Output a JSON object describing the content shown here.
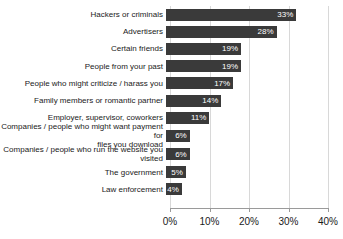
{
  "chart_data": {
    "type": "bar",
    "orientation": "horizontal",
    "title": "",
    "subtitle": "",
    "xlabel": "",
    "ylabel": "",
    "xlim": [
      0,
      40
    ],
    "grid": true,
    "legend": false,
    "tick_labels": [
      "0%",
      "10%",
      "20%",
      "30%",
      "40%"
    ],
    "tick_values": [
      0,
      10,
      20,
      30,
      40
    ],
    "categories": [
      "Hackers or criminals",
      "Advertisers",
      "Certain friends",
      "People from your past",
      "People who might criticize / harass you",
      "Family members or romantic partner",
      "Employer, supervisor, coworkers",
      "Companies / people who might want payment for\nfiles you download",
      "Companies / people who run the website you\nvisited",
      "The government",
      "Law enforcement"
    ],
    "values": [
      33,
      28,
      19,
      19,
      17,
      14,
      11,
      6,
      6,
      5,
      4
    ],
    "value_labels": [
      "33%",
      "28%",
      "19%",
      "19%",
      "17%",
      "14%",
      "11%",
      "6%",
      "6%",
      "5%",
      "4%"
    ],
    "bar_color": "#3a3a3a",
    "value_label_color": "#ffffff",
    "gridline_color": "#d8d8d8",
    "axis_color": "#9a9a9a",
    "background_color": "#ffffff"
  }
}
